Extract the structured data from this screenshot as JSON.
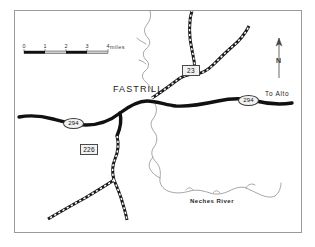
{
  "map": {
    "title": "Fastrill area road map",
    "places": [
      {
        "name": "FASTRILL",
        "type": "town"
      }
    ],
    "town_label": "FASTRILL",
    "river_label": "Neches River",
    "destination_label": "To Alto",
    "north_label": "N",
    "scale": {
      "ticks": [
        "0",
        "1",
        "2",
        "3",
        "4"
      ],
      "units": "miles"
    },
    "shields": [
      {
        "id": "23",
        "shape": "rectangle",
        "label": "23"
      },
      {
        "id": "226",
        "shape": "rectangle",
        "label": "226"
      },
      {
        "id": "294-west",
        "shape": "oval",
        "label": "294"
      },
      {
        "id": "294-east",
        "shape": "oval",
        "label": "294"
      }
    ],
    "colors": {
      "paved_road": "#111111",
      "gravel_road": "#1a1a1a",
      "river": "#9b9b9b",
      "border": "#9a9a9a",
      "background": "#ffffff",
      "shield_fill": "#f2f2f2"
    },
    "icons": {
      "north_arrow": "north-arrow-icon",
      "scale_bar": "scale-bar-icon"
    }
  }
}
